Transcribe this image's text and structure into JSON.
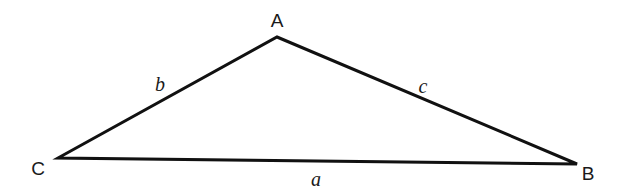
{
  "diagram": {
    "type": "triangle",
    "stroke_color": "#111111",
    "vertices": [
      {
        "name": "A",
        "x": 277,
        "y": 37,
        "label_x": 277,
        "label_y": 27
      },
      {
        "name": "B",
        "x": 577,
        "y": 164,
        "label_x": 588,
        "label_y": 180
      },
      {
        "name": "C",
        "x": 58,
        "y": 158,
        "label_x": 38,
        "label_y": 175
      }
    ],
    "sides": [
      {
        "name": "a",
        "between": "C-B",
        "label_x": 316,
        "label_y": 186
      },
      {
        "name": "b",
        "between": "C-A",
        "label_x": 160,
        "label_y": 91
      },
      {
        "name": "c",
        "between": "A-B",
        "label_x": 423,
        "label_y": 93
      }
    ]
  }
}
